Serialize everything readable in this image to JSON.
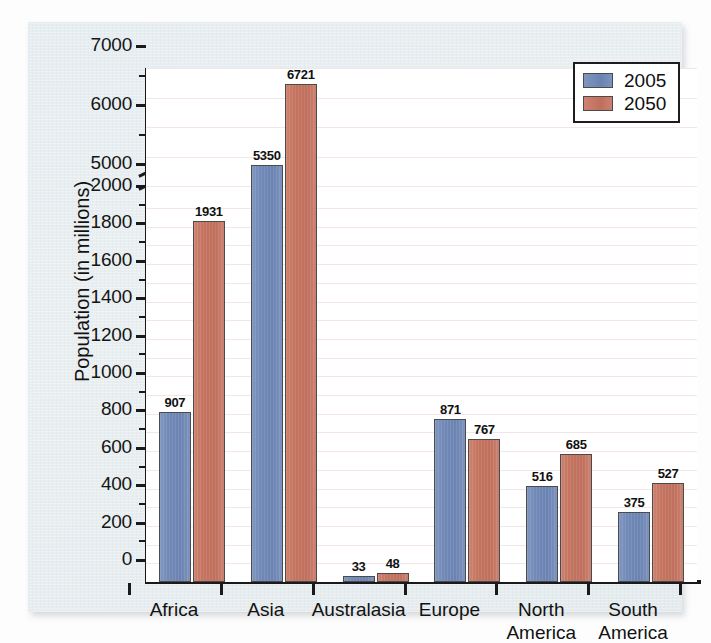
{
  "chart_data": {
    "type": "bar",
    "title": "",
    "subtitle": "",
    "xlabel": "",
    "ylabel": "Population (in millions)",
    "categories": [
      "Africa",
      "Asia",
      "Australasia",
      "Europe",
      "North America",
      "South America"
    ],
    "series": [
      {
        "name": "2005",
        "color": "#6f88b6",
        "values": [
          907,
          5350,
          33,
          871,
          516,
          375
        ]
      },
      {
        "name": "2050",
        "color": "#c3735e",
        "values": [
          1931,
          6721,
          48,
          767,
          685,
          527
        ]
      }
    ],
    "legend": {
      "position": "top-right",
      "entries": [
        "2005",
        "2050"
      ]
    },
    "grid": true,
    "axis_break": {
      "present": true,
      "between": [
        2000,
        5000
      ]
    },
    "ylim": [
      0,
      7000
    ],
    "ytick_labels": [
      "0",
      "200",
      "400",
      "600",
      "800",
      "1000",
      "1200",
      "1400",
      "1600",
      "1800",
      "2000",
      "5000",
      "6000",
      "7000"
    ],
    "ytick_values": [
      0,
      200,
      400,
      600,
      800,
      1000,
      1200,
      1400,
      1600,
      1800,
      2000,
      5000,
      6000,
      7000
    ],
    "yminor_values": [
      100,
      300,
      500,
      700,
      900,
      1100,
      1300,
      1500,
      1700,
      1900,
      5500,
      6500
    ],
    "data_labels": {
      "Africa": {
        "2005": "907",
        "2050": "1931"
      },
      "Asia": {
        "2005": "5350",
        "2050": "6721"
      },
      "Australasia": {
        "2005": "33",
        "2050": "48"
      },
      "Europe": {
        "2005": "871",
        "2050": "767"
      },
      "North America": {
        "2005": "516",
        "2050": "685"
      },
      "South America": {
        "2005": "375",
        "2050": "527"
      }
    },
    "category_labels_wrapped": [
      [
        "Africa"
      ],
      [
        "Asia"
      ],
      [
        "Australasia"
      ],
      [
        "Europe"
      ],
      [
        "North",
        "America"
      ],
      [
        "South",
        "America"
      ]
    ]
  }
}
